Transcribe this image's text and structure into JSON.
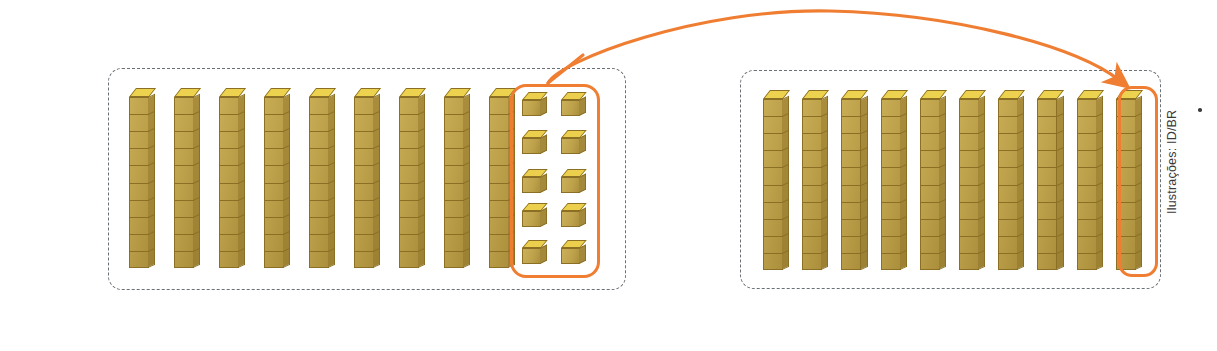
{
  "figure": {
    "kind": "base-ten-blocks-regrouping",
    "caption_credit": "Ilustrações: ID/BR",
    "accent_color": "#ef7e32",
    "block_face_color": "#bfa34c",
    "block_top_color": "#ecd24f",
    "block_side_color": "#a5893a",
    "block_edge_color": "#8a6f24",
    "box_border_color": "#6b6f76"
  },
  "left_group": {
    "name": "before-regrouping",
    "rod_count": 9,
    "rod_unit_cubes": 10,
    "loose_cubes": 10,
    "loose_cube_rows": 5,
    "loose_cube_cols": 2,
    "highlight_label": "ten-loose-ones"
  },
  "right_group": {
    "name": "after-regrouping",
    "rod_count": 10,
    "rod_unit_cubes": 10,
    "loose_cubes": 0,
    "highlighted_rod_index": 10,
    "highlight_label": "new-ten-rod"
  },
  "arrow": {
    "name": "regroup-arrow",
    "from": "ten-loose-ones",
    "to": "new-ten-rod",
    "color": "#ef7e32"
  }
}
